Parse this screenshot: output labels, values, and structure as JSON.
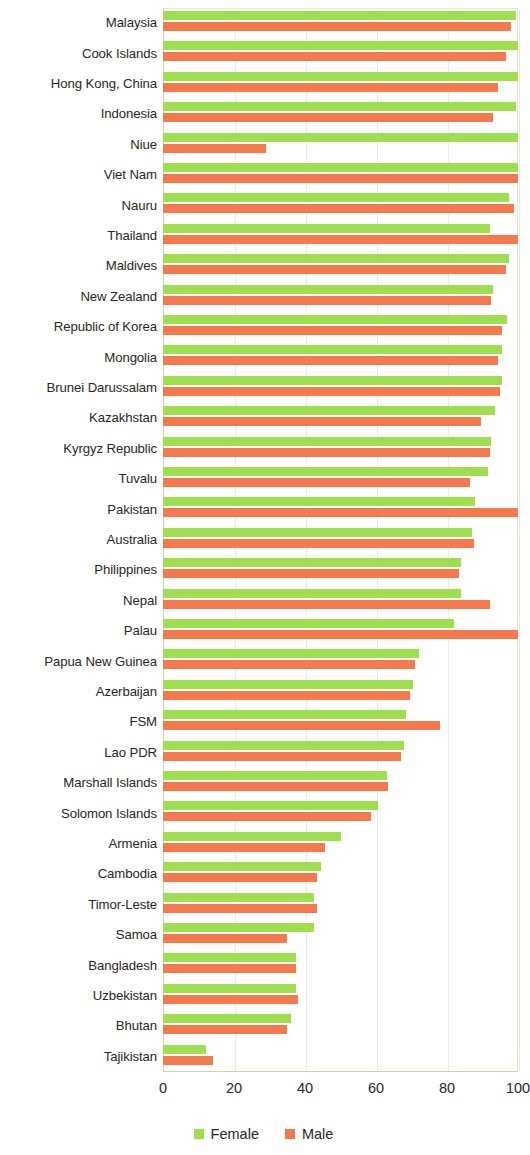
{
  "chart_data": {
    "type": "bar",
    "orientation": "horizontal",
    "title": "",
    "subtitle": "",
    "xlabel": "",
    "ylabel": "",
    "xlim": [
      0,
      100
    ],
    "ylim": null,
    "grid": true,
    "gridlines_x": [
      0,
      20,
      40,
      60,
      80,
      100
    ],
    "legend_position": "bottom-center",
    "xticks": [
      "0",
      "20",
      "40",
      "60",
      "80",
      "100"
    ],
    "xtick_values": [
      0,
      20,
      40,
      60,
      80,
      100
    ],
    "categories": [
      "Malaysia",
      "Cook Islands",
      "Hong Kong, China",
      "Indonesia",
      "Niue",
      "Viet Nam",
      "Nauru",
      "Thailand",
      "Maldives",
      "New Zealand",
      "Republic of Korea",
      "Mongolia",
      "Brunei Darussalam",
      "Kazakhstan",
      "Kyrgyz Republic",
      "Tuvalu",
      "Pakistan",
      "Australia",
      "Philippines",
      "Nepal",
      "Palau",
      "Papua New Guinea",
      "Azerbaijan",
      "FSM",
      "Lao PDR",
      "Marshall Islands",
      "Solomon Islands",
      "Armenia",
      "Cambodia",
      "Timor-Leste",
      "Samoa",
      "Bangladesh",
      "Uzbekistan",
      "Bhutan",
      "Tajikistan"
    ],
    "series": [
      {
        "name": "Female",
        "color": "#9fde4f",
        "values": [
          99.5,
          100.0,
          100.0,
          99.5,
          100.0,
          100.0,
          97.5,
          92.0,
          97.5,
          93.0,
          97.0,
          95.5,
          95.5,
          93.5,
          92.5,
          91.5,
          88.0,
          87.0,
          84.0,
          84.0,
          82.0,
          72.0,
          70.5,
          68.5,
          68.0,
          63.0,
          60.5,
          50.0,
          44.5,
          42.5,
          42.5,
          37.5,
          37.5,
          36.0,
          12.0
        ]
      },
      {
        "name": "Male",
        "color": "#f4794f",
        "values": [
          98.0,
          96.5,
          94.5,
          93.0,
          29.0,
          100.0,
          99.0,
          100.0,
          96.5,
          92.5,
          95.5,
          94.5,
          95.0,
          89.5,
          92.0,
          86.5,
          100.0,
          87.5,
          83.5,
          92.0,
          100.0,
          71.0,
          69.5,
          78.0,
          67.0,
          63.5,
          58.5,
          45.5,
          43.5,
          43.5,
          35.0,
          37.5,
          38.0,
          35.0,
          14.0
        ]
      }
    ]
  },
  "legend": {
    "items": [
      {
        "label": "Female",
        "color": "#9fde4f"
      },
      {
        "label": "Male",
        "color": "#f4794f"
      }
    ]
  }
}
